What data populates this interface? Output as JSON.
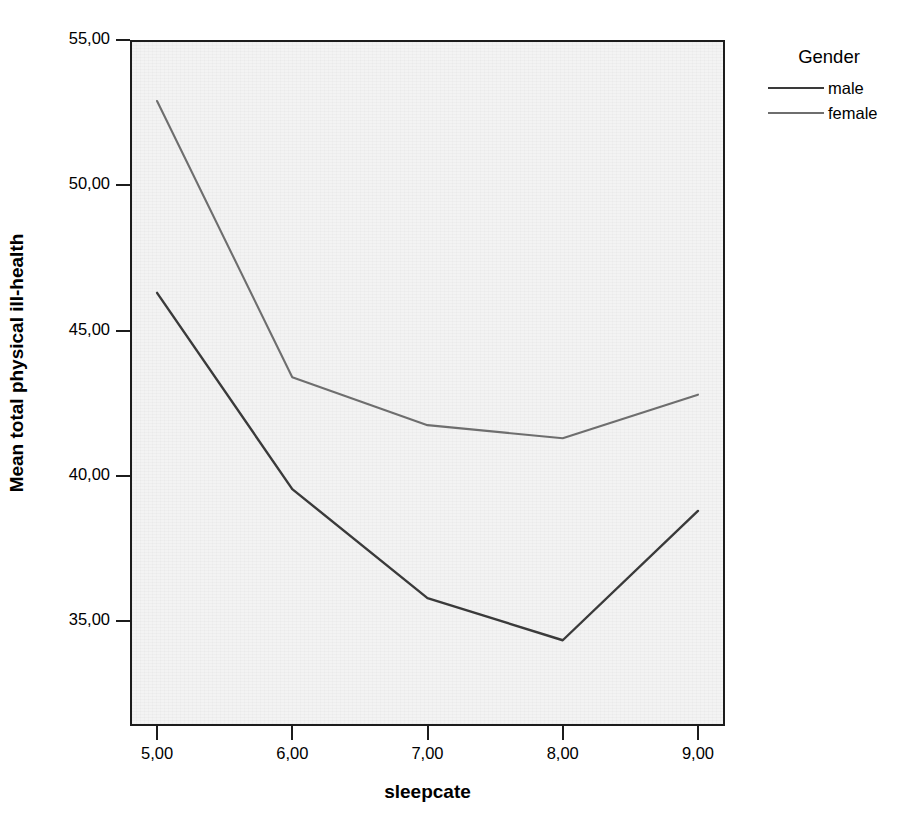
{
  "chart_data": {
    "type": "line",
    "title": "",
    "xlabel": "sleepcate",
    "ylabel": "Mean total physical ill-health",
    "x": [
      5,
      6,
      7,
      8,
      9
    ],
    "xtick_labels": [
      "5,00",
      "6,00",
      "7,00",
      "8,00",
      "9,00"
    ],
    "ytick_labels": [
      "35,00",
      "40,00",
      "45,00",
      "50,00",
      "55,00"
    ],
    "yticks": [
      35,
      40,
      45,
      50,
      55
    ],
    "xlim": [
      4.8,
      9.2
    ],
    "ylim": [
      31.4,
      55.0
    ],
    "grid": false,
    "legend_position": "right",
    "legend_title": "Gender",
    "series": [
      {
        "name": "male",
        "color": "#3a3a3a",
        "values": [
          46.3,
          39.55,
          35.8,
          34.35,
          38.8
        ]
      },
      {
        "name": "female",
        "color": "#6e6e6e",
        "values": [
          52.9,
          43.4,
          41.75,
          41.3,
          42.8
        ]
      }
    ]
  },
  "axes": {
    "x_title": "sleepcate",
    "y_title": "Mean total physical ill-health"
  },
  "legend": {
    "title": "Gender",
    "entries": [
      {
        "label": "male"
      },
      {
        "label": "female"
      }
    ]
  },
  "colors": {
    "male_line": "#3a3a3a",
    "female_line": "#6e6e6e",
    "plot_background": "#f3f3f3",
    "axis": "#1c1c1c",
    "page_background": "#ffffff"
  }
}
